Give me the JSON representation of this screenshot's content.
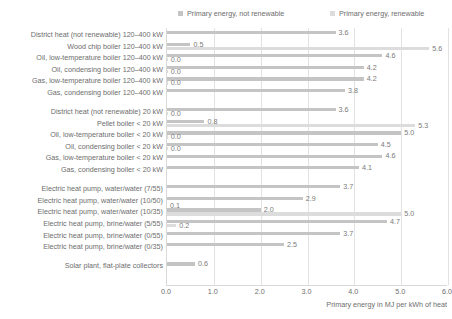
{
  "legend": {
    "items": [
      {
        "label": "Primary energy, not renewable",
        "color": "#c4c4c4"
      },
      {
        "label": "Primary energy, renewable",
        "color": "#dcdcdc"
      }
    ]
  },
  "chart_data": {
    "type": "bar",
    "orientation": "horizontal",
    "title": "",
    "xlabel": "Primary energy in MJ per kWh of heat",
    "ylabel": "",
    "xlim": [
      0.0,
      6.0
    ],
    "xticks": [
      "0.0",
      "1.0",
      "2.0",
      "3.0",
      "4.0",
      "5.0",
      "6.0"
    ],
    "xtick_values": [
      0.0,
      1.0,
      2.0,
      3.0,
      4.0,
      5.0,
      6.0
    ],
    "grid": true,
    "legend_position": "top",
    "series": [
      {
        "name": "Primary energy, not renewable",
        "color": "#c4c4c4"
      },
      {
        "name": "Primary energy, renewable",
        "color": "#dcdcdc"
      }
    ],
    "groups": [
      {
        "name": "120-400 kW",
        "rows": [
          {
            "category": "District heat (not renewable) 120–400 kW",
            "not_renewable": 3.6,
            "renewable": null,
            "nr_label": "3.6",
            "re_label": ""
          },
          {
            "category": "Wood chip boiler 120–400 kW",
            "not_renewable": 0.5,
            "renewable": 5.6,
            "nr_label": "0.5",
            "re_label": "5.6"
          },
          {
            "category": "Oil, low-temperature boiler 120–400 kW",
            "not_renewable": 4.6,
            "renewable": 0.0,
            "nr_label": "4.6",
            "re_label": "0.0"
          },
          {
            "category": "Oil, condensing boiler 120–400 kW",
            "not_renewable": 4.2,
            "renewable": 0.0,
            "nr_label": "4.2",
            "re_label": "0.0"
          },
          {
            "category": "Gas, low-temperature boiler 120–400 kW",
            "not_renewable": 4.2,
            "renewable": 0.0,
            "nr_label": "4.2",
            "re_label": "0.0"
          },
          {
            "category": "Gas, condensing boiler 120–400 kW",
            "not_renewable": 3.8,
            "renewable": null,
            "nr_label": "3.8",
            "re_label": ""
          }
        ]
      },
      {
        "name": "< 20 kW",
        "rows": [
          {
            "category": "District heat (not renewable) 20 kW",
            "not_renewable": 3.6,
            "renewable": 0.0,
            "nr_label": "3.6",
            "re_label": "0.0"
          },
          {
            "category": "Pellet boiler < 20 kW",
            "not_renewable": 0.8,
            "renewable": 5.3,
            "nr_label": "0.8",
            "re_label": "5.3"
          },
          {
            "category": "Oil, low-temperature boiler < 20 kW",
            "not_renewable": 5.0,
            "renewable": 0.0,
            "nr_label": "5.0",
            "re_label": "0.0"
          },
          {
            "category": "Oil, condensing boiler < 20 kW",
            "not_renewable": 4.5,
            "renewable": 0.0,
            "nr_label": "4.5",
            "re_label": "0.0"
          },
          {
            "category": "Gas, low-temperature boiler < 20 kW",
            "not_renewable": 4.6,
            "renewable": null,
            "nr_label": "4.6",
            "re_label": ""
          },
          {
            "category": "Gas, condensing boiler < 20 kW",
            "not_renewable": 4.1,
            "renewable": null,
            "nr_label": "4.1",
            "re_label": ""
          }
        ]
      },
      {
        "name": "Electric heat pumps",
        "rows": [
          {
            "category": "Electric heat pump, water/water (7/55)",
            "not_renewable": 3.7,
            "renewable": null,
            "nr_label": "3.7",
            "re_label": ""
          },
          {
            "category": "Electric heat pump, water/water (10/50)",
            "not_renewable": 2.9,
            "renewable": null,
            "nr_label": "2.9",
            "re_label": ""
          },
          {
            "category": "Electric heat pump, water/water (10/35)",
            "not_renewable": 2.0,
            "renewable": 5.0,
            "nr_label": "2.0",
            "re_label": "5.0"
          },
          {
            "category": "Electric heat pump, brine/water (5/55)",
            "not_renewable": 4.7,
            "renewable": 0.2,
            "nr_label": "4.7",
            "re_label": "0.2"
          },
          {
            "category": "Electric heat pump, brine/water (0/55)",
            "not_renewable": 3.7,
            "renewable": null,
            "nr_label": "3.7",
            "re_label": ""
          },
          {
            "category": "Electric heat pump, brine/water (0/35)",
            "not_renewable": 2.5,
            "renewable": null,
            "nr_label": "2.5",
            "re_label": ""
          }
        ]
      },
      {
        "name": "Solar",
        "rows": [
          {
            "category": "Solar plant, flat-plate collectors",
            "not_renewable": 0.6,
            "renewable": null,
            "nr_label": "0.6",
            "re_label": ""
          }
        ]
      }
    ],
    "extra_value_labels": [
      {
        "row": "Electric heat pump, water/water (10/35)",
        "label": "0.1",
        "series": "not_renewable_small"
      }
    ]
  }
}
